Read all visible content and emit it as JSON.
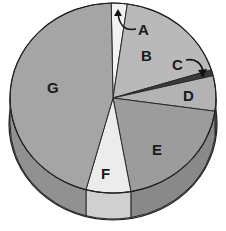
{
  "chart_data": {
    "type": "pie",
    "style": "3d-pie",
    "title": "",
    "start_angle_deg": -1,
    "direction": "clockwise",
    "slices": [
      {
        "label": "A",
        "value": 2.5,
        "color": "#f2f2f2",
        "callout": true
      },
      {
        "label": "B",
        "value": 18,
        "color": "#b9b9b9"
      },
      {
        "label": "C",
        "value": 1,
        "color": "#3a3a3a",
        "callout": true
      },
      {
        "label": "D",
        "value": 6,
        "color": "#b3b3b3"
      },
      {
        "label": "E",
        "value": 20,
        "color": "#9c9c9c"
      },
      {
        "label": "F",
        "value": 7,
        "color": "#ececec"
      },
      {
        "label": "G",
        "value": 45.5,
        "color": "#a5a5a5"
      }
    ],
    "legend": "none",
    "grid": false,
    "value_labels_shown": false
  },
  "labels": {
    "a": "A",
    "b": "B",
    "c": "C",
    "d": "D",
    "e": "E",
    "f": "F",
    "g": "G"
  }
}
